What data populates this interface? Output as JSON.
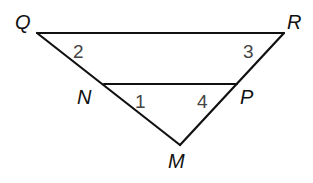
{
  "diagram": {
    "type": "triangle-with-parallel-segment",
    "vertices": [
      "Q",
      "R",
      "N",
      "P",
      "M"
    ],
    "segments": [
      [
        "Q",
        "R"
      ],
      [
        "Q",
        "M"
      ],
      [
        "R",
        "M"
      ],
      [
        "N",
        "P"
      ]
    ],
    "vertex_labels": {
      "Q": "Q",
      "R": "R",
      "N": "N",
      "P": "P",
      "M": "M"
    },
    "angle_labels": {
      "a2": "2",
      "a3": "3",
      "a1": "1",
      "a4": "4"
    },
    "colors": {
      "line": "#111111",
      "angle_number": "#444444",
      "background": "#ffffff"
    }
  }
}
